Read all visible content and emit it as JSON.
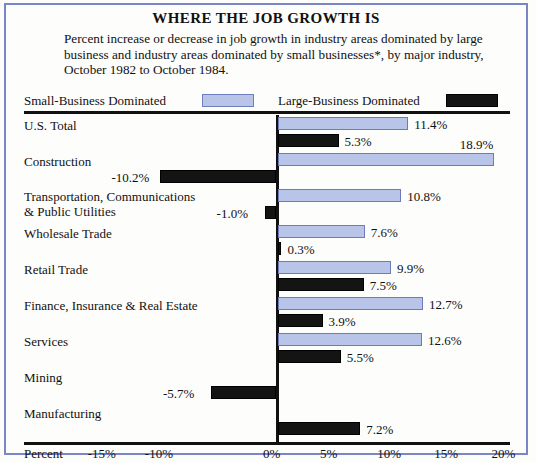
{
  "header": {
    "title": "WHERE THE JOB GROWTH IS",
    "subtitle": "Percent increase or decrease in job growth in industry areas dominated by large business and industry areas dominated by small businesses*, by major industry, October 1982 to October 1984."
  },
  "legend": {
    "small_label": "Small-Business Dominated",
    "large_label": "Large-Business Dominated",
    "small_color": "#b9c5e8",
    "large_color": "#141414"
  },
  "axis": {
    "percent_word": "Percent",
    "ticks": [
      "-15%",
      "-10%",
      "-5%",
      "0%",
      "5%",
      "10%",
      "15%",
      "20%"
    ],
    "ticks_shown": [
      "-15%",
      "-10%",
      "0%",
      "5%",
      "10%",
      "15%",
      "20%"
    ]
  },
  "chart_data": {
    "type": "bar",
    "title": "WHERE THE JOB GROWTH IS",
    "subtitle": "Percent increase or decrease in job growth in industry areas dominated by large business and industry areas dominated by small businesses*, by major industry, October 1982 to October 1984.",
    "orientation": "horizontal",
    "xlabel": "Percent",
    "ylabel": "",
    "xlim": [
      -15,
      20
    ],
    "xticks": [
      -15,
      -10,
      0,
      5,
      10,
      15,
      20
    ],
    "grid": false,
    "legend_position": "top",
    "categories": [
      "U.S. Total",
      "Construction",
      "Transportation, Communications\n& Public Utilities",
      "Wholesale Trade",
      "Retail Trade",
      "Finance, Insurance & Real Estate",
      "Services",
      "Mining",
      "Manufacturing"
    ],
    "series": [
      {
        "name": "Small-Business Dominated",
        "color": "#b9c5e8",
        "values": [
          11.4,
          18.9,
          10.8,
          7.6,
          9.9,
          12.7,
          12.6,
          null,
          null
        ],
        "labels": [
          "11.4%",
          "18.9%",
          "10.8%",
          "7.6%",
          "9.9%",
          "12.7%",
          "12.6%",
          "",
          ""
        ]
      },
      {
        "name": "Large-Business Dominated",
        "color": "#141414",
        "values": [
          5.3,
          -10.2,
          -1.0,
          0.3,
          7.5,
          3.9,
          5.5,
          -5.7,
          7.2
        ],
        "labels": [
          "5.3%",
          "-10.2%",
          "-1.0%",
          "0.3%",
          "7.5%",
          "3.9%",
          "5.5%",
          "-5.7%",
          "7.2%"
        ]
      }
    ]
  }
}
